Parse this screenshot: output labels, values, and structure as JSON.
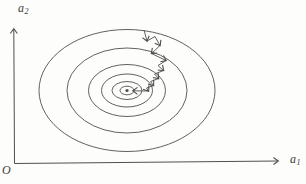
{
  "colors": {
    "background": "#fdfdfb",
    "line": "#4f4f4f",
    "text": "#3a3a3a"
  },
  "labels": {
    "y_axis": {
      "base": "a",
      "sub": "2"
    },
    "x_axis": {
      "base": "a",
      "sub": "1"
    },
    "origin": "O"
  },
  "diagram": {
    "width": 306,
    "height": 184,
    "contours": {
      "center": [
        127,
        90.5
      ],
      "radii": [
        [
          88,
          61
        ],
        [
          60,
          42.5
        ],
        [
          38.5,
          26
        ],
        [
          25.5,
          16.5
        ],
        [
          15,
          9
        ],
        [
          7,
          4.3
        ]
      ],
      "center_dot_radius": 1.6
    },
    "axes": {
      "y": {
        "from": [
          14.5,
          163.5
        ],
        "to": [
          13.8,
          29
        ]
      },
      "x": {
        "from": [
          14.5,
          163.5
        ],
        "to": [
          278,
          161
        ]
      }
    },
    "descent_path": {
      "segments": [
        [
          [
            144,
            30
          ],
          [
            147,
            41
          ]
        ],
        [
          [
            147,
            41
          ],
          [
            155,
            36.5
          ],
          [
            160,
            45.5
          ]
        ],
        [
          [
            160,
            45.5
          ],
          [
            151.5,
            53.5
          ]
        ],
        [
          [
            151.5,
            53.5
          ],
          [
            166,
            60.5
          ]
        ],
        [
          [
            166,
            60.5
          ],
          [
            158,
            65.5
          ],
          [
            163.5,
            70.5
          ]
        ],
        [
          [
            163.5,
            70.5
          ],
          [
            154.5,
            74
          ],
          [
            158.5,
            78.5
          ]
        ],
        [
          [
            158.5,
            78.5
          ],
          [
            150.5,
            81.5
          ],
          [
            153.5,
            85.5
          ]
        ],
        [
          [
            153.5,
            85.5
          ],
          [
            146.5,
            88
          ],
          [
            148.5,
            91
          ]
        ],
        [
          [
            148.5,
            91
          ],
          [
            133,
            90.8
          ]
        ]
      ]
    }
  }
}
